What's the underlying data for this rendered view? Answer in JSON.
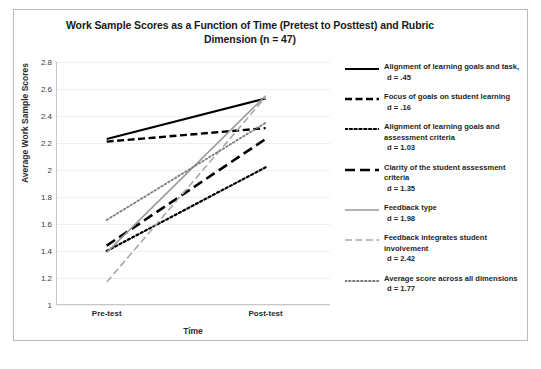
{
  "chart_data": {
    "type": "line",
    "title": "Work Sample Scores as a Function of Time (Pretest to Posttest) and Rubric Dimension (n = 47)",
    "xlabel": "Time",
    "ylabel": "Average Work Sample Scores",
    "categories": [
      "Pre-test",
      "Post-test"
    ],
    "ylim": [
      1,
      2.8
    ],
    "ytick_labels": [
      "2.8",
      "2.6",
      "2.4",
      "2.2",
      "2",
      "1.8",
      "1.6",
      "1.4",
      "1.2",
      "1"
    ],
    "ytick_values": [
      2.8,
      2.6,
      2.4,
      2.2,
      2.0,
      1.8,
      1.6,
      1.4,
      1.2,
      1.0
    ],
    "grid": true,
    "legend_position": "right",
    "series": [
      {
        "name": "Alignment of learning goals and task,",
        "effect_size_label": "d = .45",
        "values": [
          2.23,
          2.53
        ],
        "style": "solid",
        "color": "#000000",
        "width": 2.2
      },
      {
        "name": "Focus of goals on student learning",
        "effect_size_label": "d = .16",
        "values": [
          2.21,
          2.31
        ],
        "style": "dashed",
        "color": "#000000",
        "width": 2.4
      },
      {
        "name": "Alignment of learning goals and\nassessment criteria",
        "effect_size_label": "d = 1.03",
        "values": [
          1.4,
          2.02
        ],
        "style": "dotted",
        "color": "#000000",
        "width": 2.2
      },
      {
        "name": "Clarity of the student assessment criteria",
        "effect_size_label": "d = 1.35",
        "values": [
          1.44,
          2.23
        ],
        "style": "long-dash",
        "color": "#000000",
        "width": 2.6
      },
      {
        "name": "Feedback type",
        "effect_size_label": "d = 1.98",
        "values": [
          1.39,
          2.55
        ],
        "style": "solid",
        "color": "#9a9a9a",
        "width": 1.6
      },
      {
        "name": "Feedback integrates student involvement",
        "effect_size_label": "d = 2.42",
        "values": [
          1.17,
          2.54
        ],
        "style": "dashed",
        "color": "#a8a8a8",
        "width": 1.6
      },
      {
        "name": "Average score across all dimensions",
        "effect_size_label": "d = 1.77",
        "values": [
          1.63,
          2.35
        ],
        "style": "fine-dotted",
        "color": "#7d7d7d",
        "width": 1.8
      }
    ]
  },
  "legend": {
    "items": [
      {
        "label": "Alignment of learning goals and task,",
        "sub": "d = .45",
        "icon": "solid-black-line-swatch"
      },
      {
        "label": "Focus of goals on student learning",
        "sub": "d = .16",
        "icon": "dashed-black-line-swatch"
      },
      {
        "label": "Alignment of learning goals and\nassessment criteria",
        "sub": "d = 1.03",
        "icon": "dotted-black-line-swatch"
      },
      {
        "label": "Clarity of the student assessment criteria",
        "sub": "d = 1.35",
        "icon": "long-dash-black-line-swatch"
      },
      {
        "label": "Feedback type",
        "sub": "d = 1.98",
        "icon": "solid-gray-line-swatch"
      },
      {
        "label": "Feedback integrates student involvement",
        "sub": "d = 2.42",
        "icon": "dashed-gray-line-swatch"
      },
      {
        "label": "Average score across all dimensions",
        "sub": "d = 1.77",
        "icon": "fine-dotted-gray-line-swatch"
      }
    ]
  }
}
